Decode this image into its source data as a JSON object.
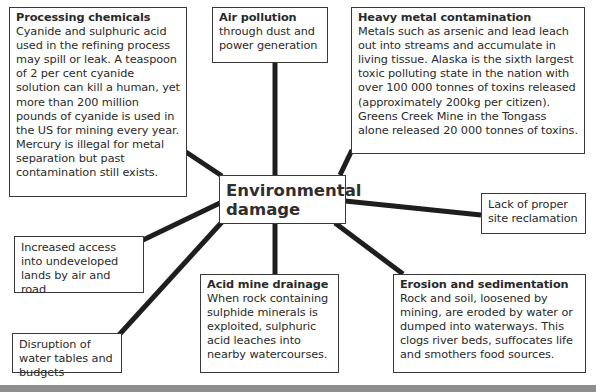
{
  "diagram": {
    "center": {
      "label": "Environmental damage"
    },
    "nodes": [
      {
        "id": "processing-chemicals",
        "title": "Processing chemicals",
        "body": "Cyanide and sulphuric acid used in the refining process may spill or leak. A teaspoon of 2 per cent cyanide solution can kill a human, yet more than 200 million pounds of cyanide is used in the US for mining every year. Mercury is illegal for metal separation but past contamination still exists."
      },
      {
        "id": "air-pollution",
        "title": "Air pollution",
        "body": "through dust and power generation"
      },
      {
        "id": "heavy-metal-contamination",
        "title": "Heavy metal contamination",
        "body": "Metals such as arsenic and lead leach out into streams and accumulate in living tissue. Alaska is the sixth largest toxic polluting state in the nation with over 100 000 tonnes of toxins released (approximately 200kg per citizen). Greens Creek Mine in the Tongass alone released 20 000 tonnes of toxins."
      },
      {
        "id": "site-reclamation",
        "title": "",
        "body": "Lack of proper site reclamation"
      },
      {
        "id": "increased-access",
        "title": "",
        "body": "Increased access into undeveloped lands by air and road"
      },
      {
        "id": "acid-mine-drainage",
        "title": "Acid mine drainage",
        "body": "When rock containing sulphide minerals is exploited, sulphuric acid leaches into nearby watercourses."
      },
      {
        "id": "erosion-sedimentation",
        "title": "Erosion and sedimentation",
        "body": "Rock and soil, loosened by mining, are eroded by water or dumped into waterways. This clogs river beds, suffocates life and smothers food sources."
      },
      {
        "id": "water-disruption",
        "title": "",
        "body": "Disruption of water tables and budgets"
      }
    ],
    "colors": {
      "line": "#1e1e1e",
      "border": "#3a3a3a",
      "text": "#2a2a2a",
      "footer_bar": "#8e8e8e"
    }
  }
}
